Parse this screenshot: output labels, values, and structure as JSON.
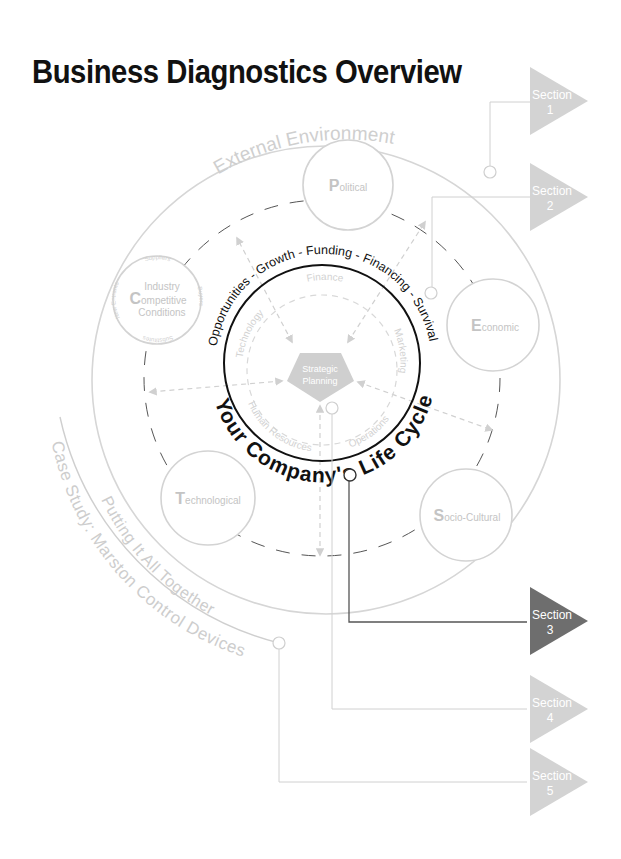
{
  "title": "Business Diagnostics Overview",
  "colors": {
    "light_gray": "#d3d3d3",
    "mid_gray": "#c4c4c4",
    "dark_section": "#6e6e6e",
    "black": "#111111"
  },
  "outer_ring_label": "External Environment",
  "life_cycle": {
    "stages_label": "Opportunities - Growth - Funding - Financing - Survival",
    "title": "Your Company's Life Cycle"
  },
  "core": {
    "label_line1": "Strategic",
    "label_line2": "Planning",
    "functions": [
      "Finance",
      "Marketing",
      "Operations",
      "Human Resources",
      "Technology"
    ]
  },
  "environment_factors": [
    {
      "initial": "P",
      "rest": "olitical"
    },
    {
      "initial": "E",
      "rest": "conomic"
    },
    {
      "initial": "S",
      "rest": "ocio-Cultural"
    },
    {
      "initial": "T",
      "rest": "echnological"
    }
  ],
  "industry": {
    "initial": "C",
    "line1": "Industry",
    "line2": "ompetitive",
    "line3": "Conditions",
    "forces": [
      "Suppliers",
      "Buyers",
      "Substitutes",
      "New Entrants"
    ]
  },
  "case_arcs": {
    "putting": "Putting It All Together",
    "case_study": "Case Study: Marston Control Devices"
  },
  "sections": [
    {
      "word": "Section",
      "num": "1",
      "active": false
    },
    {
      "word": "Section",
      "num": "2",
      "active": false
    },
    {
      "word": "Section",
      "num": "3",
      "active": true
    },
    {
      "word": "Section",
      "num": "4",
      "active": false
    },
    {
      "word": "Section",
      "num": "5",
      "active": false
    }
  ]
}
